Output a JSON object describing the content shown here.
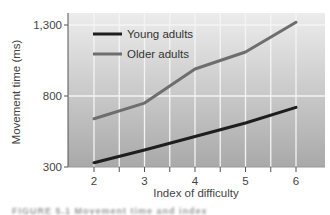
{
  "chart_data": {
    "type": "line",
    "title": "",
    "xlabel": "Index of difficulty",
    "ylabel": "Movement time (ms)",
    "x": [
      2,
      3,
      4,
      5,
      6
    ],
    "x_ticks": [
      "2",
      "3",
      "4",
      "5",
      "6"
    ],
    "x_minor_ticks": [
      2.5,
      3.5,
      4.5,
      5.5
    ],
    "xlim": [
      1.5,
      6.6
    ],
    "y_ticks": [
      300,
      800,
      1300
    ],
    "y_tick_labels": [
      "300",
      "800",
      "1,300"
    ],
    "ylim": [
      300,
      1385
    ],
    "grid": true,
    "legend_position": "upper left (inside plot)",
    "series": [
      {
        "name": "Young adults",
        "color": "#1e1e1e",
        "values": [
          330,
          420,
          515,
          610,
          720
        ]
      },
      {
        "name": "Older adults",
        "color": "#6e6e6e",
        "values": [
          640,
          750,
          990,
          1110,
          1320
        ]
      }
    ]
  },
  "caption": "FIGURE 5.1  Movement time and index"
}
